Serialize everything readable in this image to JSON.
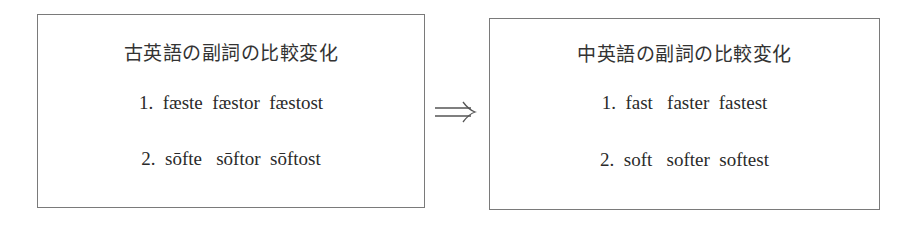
{
  "diagram": {
    "left_box": {
      "title": "古英語の副詞の比較変化",
      "rows": [
        {
          "num": "1.",
          "forms": [
            "fæste",
            "fæstor",
            "fæstost"
          ],
          "text": "1.  fæste  fæstor  fæstost"
        },
        {
          "num": "2.",
          "forms": [
            "sōfte",
            "sōftor",
            "sōftost"
          ],
          "text": "2.  sōfte   sōftor  sōftost"
        }
      ]
    },
    "arrow": {
      "icon": "double-right-arrow-icon",
      "glyph": "⟹"
    },
    "right_box": {
      "title": "中英語の副詞の比較変化",
      "rows": [
        {
          "num": "1.",
          "forms": [
            "fast",
            "faster",
            "fastest"
          ],
          "text": "1.  fast   faster  fastest"
        },
        {
          "num": "2.",
          "forms": [
            "soft",
            "softer",
            "softest"
          ],
          "text": "2.  soft   softer  softest"
        }
      ]
    },
    "colors": {
      "border": "#7a7a7a",
      "text": "#2a2a2a",
      "background": "#ffffff"
    }
  }
}
